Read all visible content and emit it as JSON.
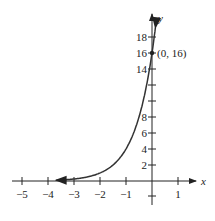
{
  "chart_data": {
    "type": "line",
    "title": "",
    "function": "y = 16 * 4^x",
    "xlabel": "x",
    "ylabel": "y",
    "xlim": [
      -5.2,
      1.3
    ],
    "ylim": [
      -1.5,
      19.5
    ],
    "x_ticks": [
      -5,
      -4,
      -3,
      -2,
      -1,
      1
    ],
    "x_tick_labels": [
      "−5",
      "−4",
      "−3",
      "−2",
      "−1",
      "1"
    ],
    "y_ticks": [
      2,
      4,
      6,
      8,
      10,
      12,
      14,
      16,
      18
    ],
    "y_tick_labels": [
      "2",
      "4",
      "6",
      "8",
      "",
      "",
      "14",
      "16",
      "18"
    ],
    "grid": false,
    "series": [
      {
        "name": "curve",
        "x": [
          -3.7,
          -3,
          -2,
          -1,
          -0.5,
          0,
          0.13
        ],
        "y": [
          0.096,
          0.25,
          1,
          4,
          8,
          16,
          19.0
        ]
      }
    ],
    "annotations": [
      {
        "text": "(0, 16)",
        "x": 0,
        "y": 16
      }
    ]
  }
}
